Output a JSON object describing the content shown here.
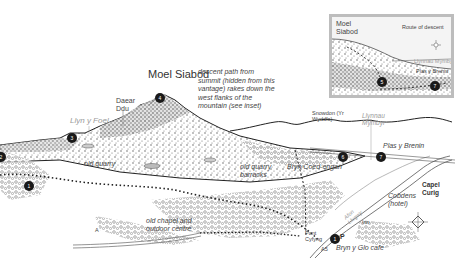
{
  "map": {
    "title": "Moel Siabod",
    "labels": {
      "moel_siabod": "Moel Siabod",
      "daear_ddu": "Daear Ddu",
      "llyn_y_foel": "Llyn y Foel",
      "descent_note": "descent path from summit (hidden from this vantage) rakes down the west flanks of the mountain (see inset)",
      "snowdon": "Snowdon (Yr Wyddfa)",
      "llynnau_mymbyr": "Llynnau Mymbyr",
      "plas_y_brenin": "Plas y Brenin",
      "old_quarry": "old quarry",
      "old_quarry_barracks": "old quarry barracks",
      "bryn_coed_engan": "Bryn Coed-engan",
      "capel_curig": "Capel Curig",
      "cobdens": "Cobdens (hotel)",
      "afon_llugwy": "Afon Llugwy",
      "pont_cyfyng": "Pont Cyfyng",
      "bryn_y_glo_cafe": "Bryn y Glo cafe",
      "old_chapel": "old chapel and outdoor centre",
      "road_a5": "A5",
      "road_b": "A",
      "parking": "P",
      "inn": "Inn"
    },
    "markers": [
      {
        "id": "summit",
        "num": "4"
      },
      {
        "id": "llyn-y-foel",
        "num": "3"
      },
      {
        "id": "west-left",
        "num": "2"
      },
      {
        "id": "west-lower",
        "num": "1"
      },
      {
        "id": "bryn-coed-engan",
        "num": "6"
      },
      {
        "id": "plas-y-brenin",
        "num": "7"
      },
      {
        "id": "pont-cyfyng",
        "num": "1"
      }
    ],
    "inset": {
      "title": "Moel Siabod",
      "caption": "Route of descent",
      "lake": "Llynnau Mymbyr",
      "place": "Plas y Brenin",
      "markers": [
        "5",
        "7"
      ]
    },
    "colors": {
      "ink": "#333333",
      "lake_label": "#9a9a9a",
      "marker": "#1a1a1a",
      "inset_border": "#bdbdbd"
    }
  }
}
